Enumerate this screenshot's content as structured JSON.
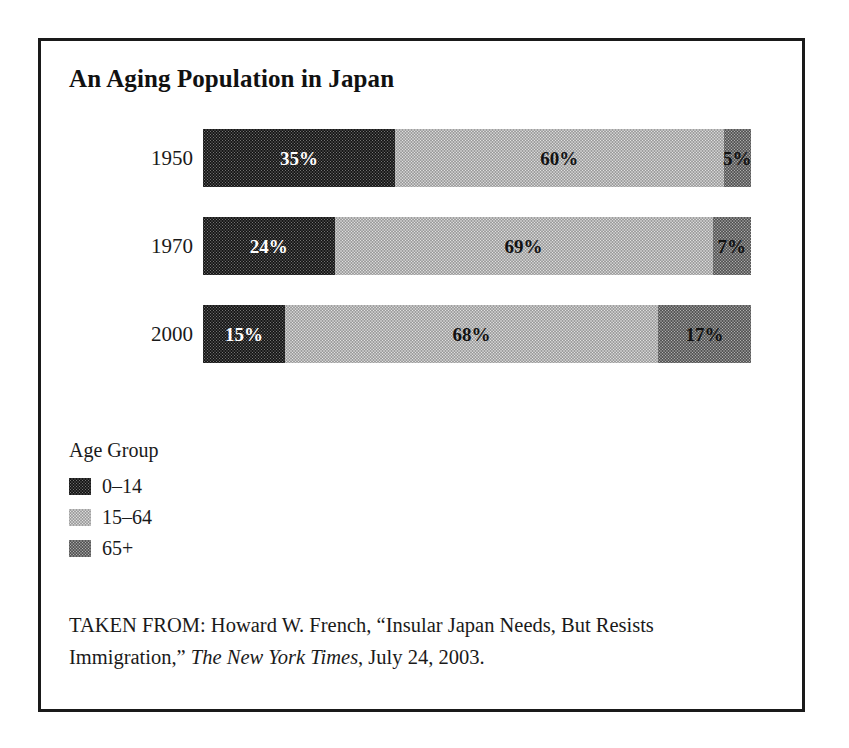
{
  "figure": {
    "title": "An Aging Population in Japan",
    "legend_title": "Age Group",
    "source_prefix": "TAKEN FROM: Howard W. French, “Insular Japan Needs, But Resists Immigration,” ",
    "source_publication": "The New York Times",
    "source_suffix": ", July 24, 2003."
  },
  "colors": {
    "series_0_14": "#737373",
    "series_15_64": "#e2e2e2",
    "series_65_plus": "#b2b2b2",
    "border": "#1a1a1a",
    "text": "#1a1a1a",
    "label_on_dark": "#ffffff",
    "label_on_light": "#121212"
  },
  "chart_data": {
    "type": "bar",
    "orientation": "horizontal",
    "stacked": true,
    "normalized": true,
    "title": "An Aging Population in Japan",
    "xlabel": "",
    "ylabel": "",
    "xlim": [
      0,
      100
    ],
    "grid": false,
    "legend_position": "below-plot-left",
    "legend_title": "Age Group",
    "categories": [
      "1950",
      "1970",
      "2000"
    ],
    "series": [
      {
        "name": "0–14",
        "fill": "dark",
        "label_color": "white",
        "values": [
          35,
          24,
          15
        ]
      },
      {
        "name": "15–64",
        "fill": "light",
        "label_color": "black",
        "values": [
          60,
          69,
          68
        ]
      },
      {
        "name": "65+",
        "fill": "mid",
        "label_color": "black",
        "values": [
          5,
          7,
          17
        ]
      }
    ],
    "value_labels": [
      [
        "35%",
        "60%",
        "5%"
      ],
      [
        "24%",
        "69%",
        "7%"
      ],
      [
        "15%",
        "68%",
        "17%"
      ]
    ],
    "rows": [
      {
        "category": "1950",
        "segments": [
          {
            "series": "0–14",
            "value": 35,
            "label": "35%",
            "fill": "dark",
            "label_color": "white"
          },
          {
            "series": "15–64",
            "value": 60,
            "label": "60%",
            "fill": "light",
            "label_color": "black"
          },
          {
            "series": "65+",
            "value": 5,
            "label": "5%",
            "fill": "mid",
            "label_color": "black"
          }
        ]
      },
      {
        "category": "1970",
        "segments": [
          {
            "series": "0–14",
            "value": 24,
            "label": "24%",
            "fill": "dark",
            "label_color": "white"
          },
          {
            "series": "15–64",
            "value": 69,
            "label": "69%",
            "fill": "light",
            "label_color": "black"
          },
          {
            "series": "65+",
            "value": 7,
            "label": "7%",
            "fill": "mid",
            "label_color": "black"
          }
        ]
      },
      {
        "category": "2000",
        "segments": [
          {
            "series": "0–14",
            "value": 15,
            "label": "15%",
            "fill": "dark",
            "label_color": "white"
          },
          {
            "series": "15–64",
            "value": 68,
            "label": "68%",
            "fill": "light",
            "label_color": "black"
          },
          {
            "series": "65+",
            "value": 17,
            "label": "17%",
            "fill": "mid",
            "label_color": "black"
          }
        ]
      }
    ],
    "legend_entries": [
      {
        "label": "0–14",
        "fill": "dark"
      },
      {
        "label": "15–64",
        "fill": "light"
      },
      {
        "label": "65+",
        "fill": "mid"
      }
    ]
  }
}
